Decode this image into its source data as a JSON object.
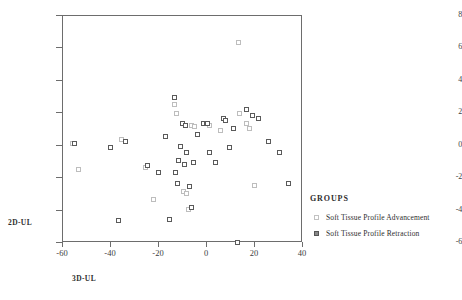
{
  "chart_data": {
    "type": "scatter",
    "title": "",
    "xlabel": "3D-UL",
    "ylabel": "2D-UL",
    "xlim": [
      -60,
      40
    ],
    "ylim": [
      -6,
      8
    ],
    "xticks": [
      -60,
      -40,
      -20,
      0,
      20,
      40
    ],
    "yticks": [
      -6,
      -4,
      -2,
      0,
      2,
      4,
      6,
      8
    ],
    "grid": false,
    "legend_position": "right",
    "legend_title": "GROUPS",
    "series": [
      {
        "name": "Soft Tissue Profile Advancement",
        "marker": "open-square-light",
        "color": "#bdbdbd",
        "points": [
          [
            -55.8,
            0.1
          ],
          [
            -53.0,
            -1.5
          ],
          [
            -35.3,
            0.3
          ],
          [
            -25.2,
            -1.4
          ],
          [
            -22.0,
            -3.4
          ],
          [
            -13.0,
            2.5
          ],
          [
            -12.2,
            1.9
          ],
          [
            -9.4,
            -2.9
          ],
          [
            -8.2,
            -3.0
          ],
          [
            -7.2,
            -4.0
          ],
          [
            -6.0,
            1.2
          ],
          [
            -4.6,
            1.1
          ],
          [
            1.6,
            1.2
          ],
          [
            6.0,
            0.9
          ],
          [
            13.5,
            6.3
          ],
          [
            14.0,
            1.9
          ],
          [
            16.8,
            1.3
          ],
          [
            18.0,
            1.0
          ],
          [
            20.0,
            -2.5
          ]
        ]
      },
      {
        "name": "Soft Tissue Profile Retraction",
        "marker": "open-square-dark",
        "color": "#5a5a5a",
        "points": [
          [
            -55.0,
            0.1
          ],
          [
            -40.0,
            -0.2
          ],
          [
            -36.5,
            -4.7
          ],
          [
            -33.4,
            0.2
          ],
          [
            -24.5,
            -1.3
          ],
          [
            -20.0,
            -1.7
          ],
          [
            -17.0,
            0.5
          ],
          [
            -15.4,
            -4.6
          ],
          [
            -13.0,
            2.9
          ],
          [
            -12.6,
            -1.7
          ],
          [
            -12.0,
            -2.4
          ],
          [
            -11.4,
            -1.0
          ],
          [
            -10.5,
            -0.1
          ],
          [
            -10.0,
            1.3
          ],
          [
            -9.0,
            -1.2
          ],
          [
            -8.6,
            1.2
          ],
          [
            -8.0,
            -0.5
          ],
          [
            -6.7,
            -2.6
          ],
          [
            -6.2,
            -3.9
          ],
          [
            -5.3,
            -1.1
          ],
          [
            -3.5,
            0.6
          ],
          [
            -1.0,
            1.3
          ],
          [
            0.2,
            1.3
          ],
          [
            0.8,
            1.3
          ],
          [
            1.5,
            -0.5
          ],
          [
            4.0,
            -1.1
          ],
          [
            7.3,
            1.6
          ],
          [
            8.0,
            1.5
          ],
          [
            9.6,
            -0.2
          ],
          [
            11.4,
            1.0
          ],
          [
            13.2,
            -6.0
          ],
          [
            17.0,
            2.2
          ],
          [
            19.4,
            1.8
          ],
          [
            22.0,
            1.6
          ],
          [
            26.0,
            0.2
          ],
          [
            30.5,
            -0.5
          ],
          [
            34.5,
            -2.4
          ]
        ]
      }
    ]
  }
}
